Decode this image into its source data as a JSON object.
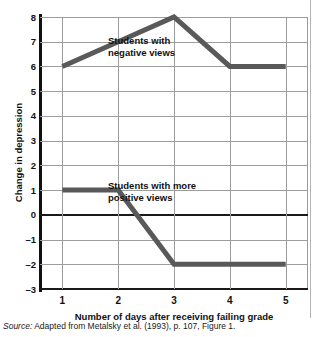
{
  "figure": {
    "clipped_header_text": "",
    "source_note": {
      "label": "Source:",
      "text": " Adapted from Metalsky et al. (1993), p. 107, Figure 1."
    }
  },
  "chart_data": {
    "type": "line",
    "title": "",
    "xlabel": "Number of days after receiving failing grade",
    "ylabel": "Change in depression",
    "x": [
      1,
      2,
      3,
      4,
      5
    ],
    "categories": [
      "1",
      "2",
      "3",
      "4",
      "5"
    ],
    "xtick_labels": [
      "1",
      "2",
      "3",
      "4",
      "5"
    ],
    "ytick_labels": [
      "8",
      "7",
      "6",
      "5",
      "4",
      "3",
      "2",
      "1",
      "0",
      "-1",
      "-2",
      "-3"
    ],
    "ytick_values": [
      8,
      7,
      6,
      5,
      4,
      3,
      2,
      1,
      0,
      -1,
      -2,
      -3
    ],
    "ylim": [
      -3,
      8
    ],
    "xlim": [
      0.6,
      5.4
    ],
    "grid": true,
    "legend": "annotations",
    "line_color": "#595959",
    "zero_line_color": "#1a1a1a",
    "grid_color": "#9d9d9d",
    "series": [
      {
        "name": "Students with negative views",
        "values": [
          6,
          7,
          8,
          6,
          6
        ],
        "annotation": "Students with\nnegative views",
        "annotation_line1": "Students with",
        "annotation_line2": "negative views"
      },
      {
        "name": "Students with more positive views",
        "values": [
          1,
          1,
          -2,
          -2,
          -2
        ],
        "annotation": "Students with more\npositive views",
        "annotation_line1": "Students with more",
        "annotation_line2": "positive views"
      }
    ]
  }
}
